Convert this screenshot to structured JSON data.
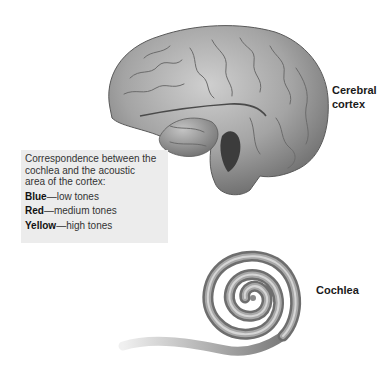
{
  "labels": {
    "cerebral_cortex_line1": "Cerebral",
    "cerebral_cortex_line2": "cortex",
    "cochlea": "Cochlea"
  },
  "legend": {
    "intro_line1": "Correspondence between the",
    "intro_line2": "cochlea and the acoustic",
    "intro_line3": "area of the cortex:",
    "entries": [
      {
        "color_name": "Blue",
        "separator": "—",
        "description": "low tones"
      },
      {
        "color_name": "Red",
        "separator": "—",
        "description": "medium tones"
      },
      {
        "color_name": "Yellow",
        "separator": "—",
        "description": "high tones"
      }
    ]
  },
  "colors": {
    "legend_background": "#ececec",
    "brain_fill": "#a8a8a8",
    "brain_shadow": "#6e6e6e",
    "cochlea_fill": "#8a8a8a",
    "cochlea_highlight": "#cfcfcf"
  }
}
